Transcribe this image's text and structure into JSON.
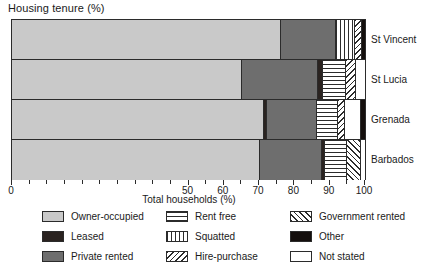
{
  "chart_data": {
    "type": "bar",
    "orientation": "horizontal",
    "stacked": true,
    "title": "Housing tenure (%)",
    "xlabel": "Total households (%)",
    "ylabel": "",
    "xlim": [
      0,
      100
    ],
    "xticks": [
      0,
      5,
      10,
      15,
      20,
      25,
      30,
      35,
      40,
      45,
      50,
      55,
      60,
      65,
      70,
      75,
      80,
      85,
      90,
      95,
      100
    ],
    "xtick_labels": [
      "0",
      "",
      "",
      "",
      "",
      "",
      "",
      "",
      "",
      "",
      "50",
      "",
      "60",
      "",
      "70",
      "",
      "80",
      "",
      "90",
      "",
      "100"
    ],
    "grid": false,
    "legend_position": "bottom",
    "categories": [
      "St Vincent",
      "St Lucia",
      "Grenada",
      "Barbados"
    ],
    "series": [
      {
        "name": "Owner-occupied",
        "values": [
          75.8,
          65.0,
          71.0,
          70.0
        ]
      },
      {
        "name": "Private rented",
        "values": [
          15.7,
          21.5,
          14.0,
          17.5
        ]
      },
      {
        "name": "Leased",
        "values": [
          0.0,
          1.3,
          1.0,
          1.0
        ]
      },
      {
        "name": "Rent free",
        "values": [
          0.0,
          6.5,
          6.0,
          6.0
        ]
      },
      {
        "name": "Squatted",
        "values": [
          5.5,
          0.0,
          0.0,
          0.0
        ]
      },
      {
        "name": "Hire-purchase",
        "values": [
          1.8,
          3.0,
          2.0,
          0.0
        ]
      },
      {
        "name": "Government rented",
        "values": [
          0.0,
          0.0,
          0.0,
          4.0
        ]
      },
      {
        "name": "Other",
        "values": [
          1.2,
          0.0,
          1.5,
          0.0
        ]
      },
      {
        "name": "Not stated",
        "values": [
          0.0,
          2.7,
          4.5,
          1.5
        ]
      }
    ],
    "stacks": [
      {
        "category": "St Vincent",
        "segments": [
          {
            "key": "owner",
            "label": "Owner-occupied",
            "start": 0.0,
            "end": 75.8
          },
          {
            "key": "private",
            "label": "Private rented",
            "start": 75.8,
            "end": 91.5
          },
          {
            "key": "squatted",
            "label": "Squatted",
            "start": 91.5,
            "end": 97.0
          },
          {
            "key": "hirepurchase",
            "label": "Hire-purchase",
            "start": 97.0,
            "end": 98.8
          },
          {
            "key": "other",
            "label": "Other",
            "start": 98.8,
            "end": 100.0
          }
        ]
      },
      {
        "category": "St Lucia",
        "segments": [
          {
            "key": "owner",
            "label": "Owner-occupied",
            "start": 0.0,
            "end": 65.0
          },
          {
            "key": "private",
            "label": "Private rented",
            "start": 65.0,
            "end": 86.5
          },
          {
            "key": "leased",
            "label": "Leased",
            "start": 86.5,
            "end": 87.8
          },
          {
            "key": "rentfree",
            "label": "Rent free",
            "start": 87.8,
            "end": 94.3
          },
          {
            "key": "hirepurchase",
            "label": "Hire-purchase",
            "start": 94.3,
            "end": 97.3
          },
          {
            "key": "notstated",
            "label": "Not stated",
            "start": 97.3,
            "end": 100.0
          }
        ]
      },
      {
        "category": "Grenada",
        "segments": [
          {
            "key": "owner",
            "label": "Owner-occupied",
            "start": 0.0,
            "end": 71.0
          },
          {
            "key": "leased",
            "label": "Leased",
            "start": 71.0,
            "end": 72.0
          },
          {
            "key": "private",
            "label": "Private rented",
            "start": 72.0,
            "end": 86.0
          },
          {
            "key": "rentfree",
            "label": "Rent free",
            "start": 86.0,
            "end": 92.0
          },
          {
            "key": "hirepurchase",
            "label": "Hire-purchase",
            "start": 92.0,
            "end": 94.0
          },
          {
            "key": "notstated",
            "label": "Not stated",
            "start": 94.0,
            "end": 98.5
          },
          {
            "key": "other",
            "label": "Other",
            "start": 98.5,
            "end": 100.0
          }
        ]
      },
      {
        "category": "Barbados",
        "segments": [
          {
            "key": "owner",
            "label": "Owner-occupied",
            "start": 0.0,
            "end": 70.0
          },
          {
            "key": "private",
            "label": "Private rented",
            "start": 70.0,
            "end": 87.5
          },
          {
            "key": "leased",
            "label": "Leased",
            "start": 87.5,
            "end": 88.5
          },
          {
            "key": "rentfree",
            "label": "Rent free",
            "start": 88.5,
            "end": 94.5
          },
          {
            "key": "govrented",
            "label": "Government rented",
            "start": 94.5,
            "end": 98.5
          },
          {
            "key": "notstated",
            "label": "Not stated",
            "start": 98.5,
            "end": 100.0
          }
        ]
      }
    ],
    "legend": [
      {
        "key": "owner",
        "label": "Owner-occupied",
        "col": 0,
        "row": 0
      },
      {
        "key": "leased",
        "label": "Leased",
        "col": 0,
        "row": 1
      },
      {
        "key": "private",
        "label": "Private rented",
        "col": 0,
        "row": 2
      },
      {
        "key": "rentfree",
        "label": "Rent free",
        "col": 1,
        "row": 0
      },
      {
        "key": "squatted",
        "label": "Squatted",
        "col": 1,
        "row": 1
      },
      {
        "key": "hirepurchase",
        "label": "Hire-purchase",
        "col": 1,
        "row": 2
      },
      {
        "key": "govrented",
        "label": "Government rented",
        "col": 2,
        "row": 0
      },
      {
        "key": "other",
        "label": "Other",
        "col": 2,
        "row": 1
      },
      {
        "key": "notstated",
        "label": "Not stated",
        "col": 2,
        "row": 2
      }
    ],
    "colors": {
      "owner": "#c9c9c9",
      "private": "#6e6e6e",
      "leased": "#2a2320",
      "other": "#140f0d",
      "notstated": "#ffffff",
      "pattern_ink": "#2b2b2b",
      "axis": "#2b2b2b",
      "text": "#1a1a1a",
      "background": "#ffffff"
    }
  }
}
